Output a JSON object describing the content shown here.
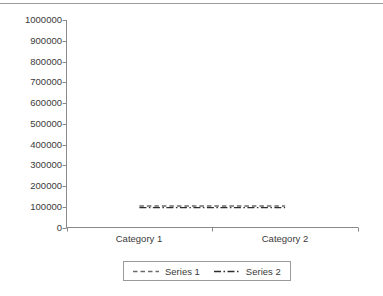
{
  "chart_data": {
    "type": "line",
    "title": "",
    "xlabel": "",
    "ylabel": "",
    "categories": [
      "Category 1",
      "Category 2"
    ],
    "series": [
      {
        "name": "Series 1",
        "values": [
          100000,
          100000
        ],
        "line_style": "dashed",
        "color": "#6b6b6b"
      },
      {
        "name": "Series 2",
        "values": [
          100000,
          100000
        ],
        "line_style": "dash-dot",
        "color": "#2e2e2e"
      }
    ],
    "ylim": [
      0,
      1000000
    ],
    "ytick_values": [
      0,
      100000,
      200000,
      300000,
      400000,
      500000,
      600000,
      700000,
      800000,
      900000,
      1000000
    ],
    "ytick_labels": [
      "0",
      "100000",
      "200000",
      "300000",
      "400000",
      "500000",
      "600000",
      "700000",
      "800000",
      "900000",
      "1000000"
    ],
    "grid": false,
    "legend_position": "bottom-center"
  },
  "axes": {
    "axis_color": "#8a8a8a",
    "text_color": "#3a3a3a"
  },
  "decor": {
    "top_rule_color": "#9a9a9a"
  }
}
